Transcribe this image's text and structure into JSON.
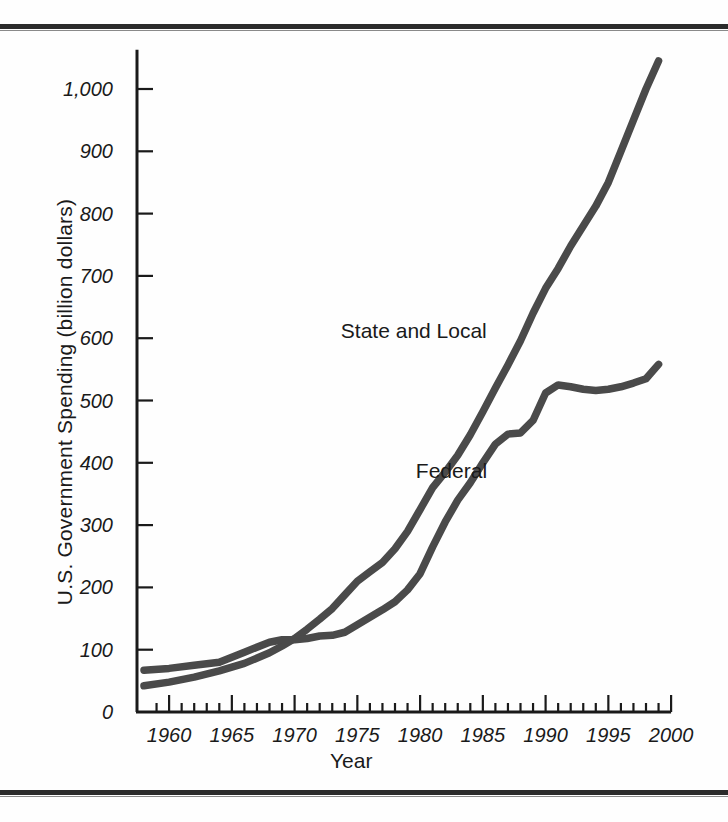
{
  "figure": {
    "background_color": "#fefefe",
    "rule_color": "#2b2b2b",
    "line_color": "#4a4a4a",
    "axis_color": "#1a1a1a"
  },
  "chart_data": {
    "type": "line",
    "title": "",
    "xlabel": "Year",
    "ylabel": "U.S. Government Spending (billion dollars)",
    "xlim": [
      1958,
      2000
    ],
    "ylim": [
      0,
      1050
    ],
    "xticks": [
      1960,
      1965,
      1970,
      1975,
      1980,
      1985,
      1990,
      1995,
      2000
    ],
    "xtick_labels": [
      "1960",
      "1965",
      "1970",
      "1975",
      "1980",
      "1985",
      "1990",
      "1995",
      "2000"
    ],
    "xminor_step": 1,
    "yticks": [
      0,
      100,
      200,
      300,
      400,
      500,
      600,
      700,
      800,
      900,
      1000
    ],
    "ytick_labels": [
      "0",
      "100",
      "200",
      "300",
      "400",
      "500",
      "600",
      "700",
      "800",
      "900",
      "1,000"
    ],
    "grid": false,
    "legend_position": "inline-annotation",
    "series": [
      {
        "name": "State and Local",
        "label": "State and Local",
        "color": "#4a4a4a",
        "label_x": 1979.5,
        "label_y": 610,
        "x": [
          1958,
          1960,
          1962,
          1964,
          1966,
          1968,
          1969,
          1970,
          1971,
          1972,
          1973,
          1974,
          1975,
          1976,
          1977,
          1978,
          1979,
          1980,
          1981,
          1982,
          1983,
          1984,
          1985,
          1986,
          1987,
          1988,
          1989,
          1990,
          1991,
          1992,
          1993,
          1994,
          1995,
          1996,
          1997,
          1998,
          1999
        ],
        "y": [
          42,
          48,
          56,
          66,
          78,
          95,
          106,
          118,
          133,
          149,
          166,
          188,
          210,
          225,
          240,
          262,
          290,
          325,
          360,
          385,
          412,
          445,
          482,
          520,
          557,
          596,
          640,
          680,
          712,
          748,
          780,
          812,
          850,
          900,
          950,
          1000,
          1045
        ]
      },
      {
        "name": "Federal",
        "label": "Federal",
        "color": "#4a4a4a",
        "label_x": 1982.5,
        "label_y": 385,
        "x": [
          1958,
          1960,
          1962,
          1964,
          1966,
          1968,
          1969,
          1970,
          1971,
          1972,
          1973,
          1974,
          1975,
          1976,
          1977,
          1978,
          1979,
          1980,
          1981,
          1982,
          1983,
          1984,
          1985,
          1986,
          1987,
          1988,
          1989,
          1990,
          1991,
          1992,
          1993,
          1994,
          1995,
          1996,
          1997,
          1998,
          1999
        ],
        "y": [
          67,
          70,
          75,
          80,
          96,
          112,
          116,
          116,
          118,
          122,
          123,
          128,
          140,
          152,
          164,
          177,
          196,
          222,
          265,
          305,
          340,
          368,
          400,
          430,
          446,
          448,
          468,
          512,
          525,
          522,
          518,
          516,
          518,
          522,
          528,
          535,
          558
        ]
      }
    ]
  },
  "axis_titles": {
    "y": "U.S. Government Spending (billion dollars)",
    "x": "Year"
  }
}
